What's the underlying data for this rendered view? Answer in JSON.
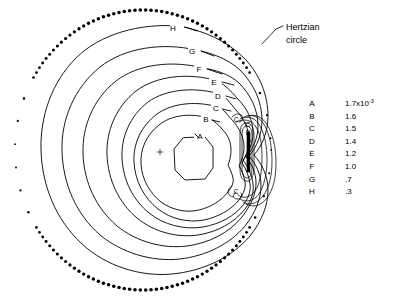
{
  "figure": {
    "title": "",
    "background_color": "#ffffff",
    "line_color": "#000000"
  },
  "annotations": [
    {
      "id": "hertzian",
      "line1": "Hertzian",
      "line2": "circle",
      "x": 286,
      "y": 30
    }
  ],
  "contour_labels": [
    {
      "label": "H",
      "x": 176,
      "y": 28
    },
    {
      "label": "G",
      "x": 192,
      "y": 51
    },
    {
      "label": "F",
      "x": 199,
      "y": 69
    },
    {
      "label": "E",
      "x": 214,
      "y": 82
    },
    {
      "label": "D",
      "x": 219,
      "y": 96
    },
    {
      "label": "C",
      "x": 216,
      "y": 107
    },
    {
      "label": "B",
      "x": 206,
      "y": 118
    },
    {
      "label": "A",
      "x": 200,
      "y": 136
    },
    {
      "label": "C",
      "x": 238,
      "y": 120
    },
    {
      "label": "C",
      "x": 249,
      "y": 125
    },
    {
      "label": "B",
      "x": 249,
      "y": 133
    },
    {
      "label": "A",
      "x": 250,
      "y": 140
    },
    {
      "label": "C",
      "x": 243,
      "y": 190
    }
  ],
  "legend": {
    "rows": [
      {
        "key": "A",
        "value": "1.7x10",
        "exponent": "-3"
      },
      {
        "key": "B",
        "value": "1.6",
        "exponent": ""
      },
      {
        "key": "C",
        "value": "1.5",
        "exponent": ""
      },
      {
        "key": "D",
        "value": "1.4",
        "exponent": ""
      },
      {
        "key": "E",
        "value": "1.2",
        "exponent": ""
      },
      {
        "key": "F",
        "value": "1.0",
        "exponent": ""
      },
      {
        "key": "G",
        "value": ".7",
        "exponent": ""
      },
      {
        "key": "H",
        "value": ".3",
        "exponent": ""
      }
    ],
    "key_x": 312,
    "value_x": 345,
    "start_y": 106,
    "row_step": 12.6
  },
  "chart_data": {
    "type": "contour",
    "title": "",
    "xlabel": "",
    "ylabel": "",
    "contour_levels": [
      {
        "label": "A",
        "value": 0.0017
      },
      {
        "label": "B",
        "value": 0.0016
      },
      {
        "label": "C",
        "value": 0.0015
      },
      {
        "label": "D",
        "value": 0.0014
      },
      {
        "label": "E",
        "value": 0.0012
      },
      {
        "label": "F",
        "value": 0.001
      },
      {
        "label": "G",
        "value": 0.0007
      },
      {
        "label": "H",
        "value": 0.0003
      }
    ],
    "boundary": {
      "name": "Hertzian circle",
      "style": "dotted",
      "center_x": 143,
      "center_y": 150,
      "radius_x": 128,
      "radius_y": 140
    },
    "legend_position": "right"
  }
}
